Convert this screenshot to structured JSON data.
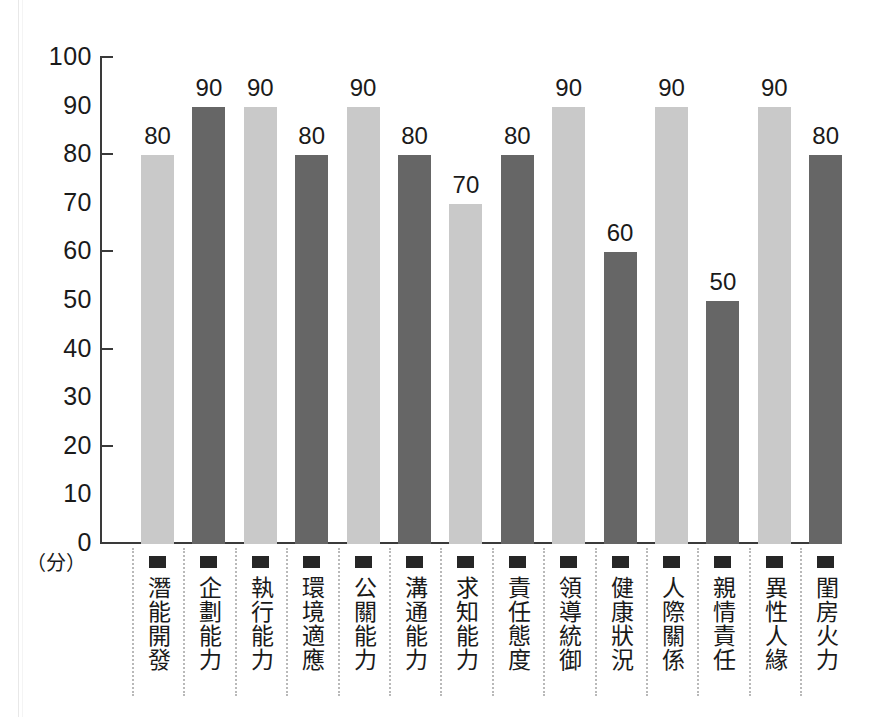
{
  "chart_data": {
    "type": "bar",
    "title": "",
    "subtitle": "",
    "xlabel": "",
    "ylabel": "",
    "unit_label": "（分）",
    "ylim": [
      0,
      100
    ],
    "y_ticks": [
      100,
      90,
      80,
      70,
      60,
      50,
      40,
      30,
      20,
      10,
      0
    ],
    "y_tick_marks": [
      100,
      80,
      60,
      40,
      20
    ],
    "grid": false,
    "legend": "none",
    "categories": [
      "潛能開發",
      "企劃能力",
      "執行能力",
      "環境適應",
      "公關能力",
      "溝通能力",
      "求知能力",
      "責任態度",
      "領導統御",
      "健康狀況",
      "人際關係",
      "親情責任",
      "異性人緣",
      "閨房火力"
    ],
    "values": [
      80,
      90,
      90,
      80,
      90,
      80,
      70,
      80,
      90,
      60,
      90,
      50,
      90,
      80
    ],
    "bar_colors": [
      "#c9c9c9",
      "#666666",
      "#c9c9c9",
      "#666666",
      "#c9c9c9",
      "#666666",
      "#c9c9c9",
      "#666666",
      "#c9c9c9",
      "#666666",
      "#c9c9c9",
      "#666666",
      "#c9c9c9",
      "#666666"
    ],
    "palette": {
      "light_bar": "#c9c9c9",
      "dark_bar": "#666666",
      "axis": "#3a3a3a",
      "text": "#1a1a1a",
      "separator": "#b9b9b9",
      "bullet": "#262626",
      "background": "#ffffff"
    }
  }
}
